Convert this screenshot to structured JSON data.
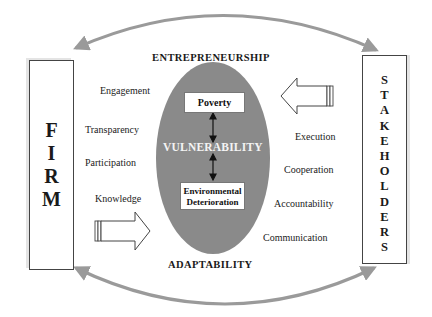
{
  "diagram": {
    "left_entity": {
      "label": "FIRM",
      "letters": [
        "F",
        "I",
        "R",
        "M"
      ]
    },
    "right_entity": {
      "label": "STAKEHOLDERS",
      "letters": [
        "S",
        "T",
        "A",
        "K",
        "E",
        "H",
        "O",
        "L",
        "D",
        "E",
        "R",
        "S"
      ]
    },
    "top_heading": "ENTREPRENEURSHIP",
    "bottom_heading": "ADAPTABILITY",
    "center": {
      "label": "VULNERABILITY",
      "top_box": "Poverty",
      "bottom_box_line1": "Environmental",
      "bottom_box_line2": "Deterioration",
      "fill_color": "#8a8a8a"
    },
    "firm_attributes": [
      "Engagement",
      "Transparency",
      "Participation",
      "Knowledge"
    ],
    "stakeholder_attributes": [
      "Execution",
      "Cooperation",
      "Accountability",
      "Communication"
    ],
    "connectors": {
      "top_arc": "double-headed curved arrow between FIRM and STAKEHOLDERS",
      "bottom_arc": "double-headed curved arrow between FIRM and STAKEHOLDERS",
      "firm_arrow": "block arrow pointing right toward center",
      "stakeholder_arrow": "block arrow pointing left toward center",
      "arc_color": "#9a9a9a"
    }
  }
}
